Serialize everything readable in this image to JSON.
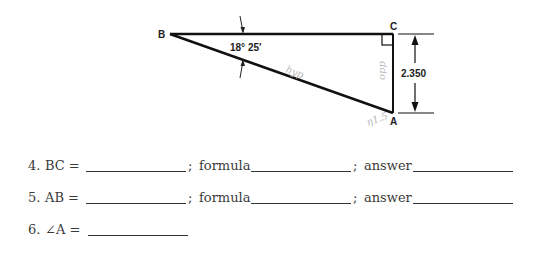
{
  "diagram": {
    "vertices": {
      "B": {
        "label": "B"
      },
      "C": {
        "label": "C"
      },
      "A": {
        "label": "A"
      }
    },
    "angle_B": "18° 25′",
    "side_CA_dimension": "2.350",
    "right_angle_at": "C",
    "handwritten_marks": [
      "hyp",
      "opp",
      "η1.5"
    ]
  },
  "questions": [
    {
      "number": "4.",
      "lhs": "BC =",
      "sep1": ";",
      "formula_label": "formula",
      "sep2": ";",
      "answer_label": "answer"
    },
    {
      "number": "5.",
      "lhs": "AB =",
      "sep1": ";",
      "formula_label": "formula",
      "sep2": ";",
      "answer_label": "answer"
    },
    {
      "number": "6.",
      "lhs": "∠A ="
    }
  ]
}
